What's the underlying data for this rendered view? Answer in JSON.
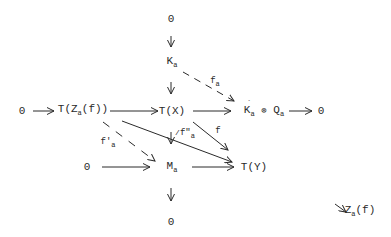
{
  "diagram": {
    "type": "commutative-diagram",
    "nodes": {
      "top_zero": "0",
      "K_a": {
        "base": "K",
        "sub": "a"
      },
      "row1_left_zero": "0",
      "T_Za_f": {
        "pre": "T(Z",
        "sub": "a",
        "post": "(f))"
      },
      "T_X": "T(X)",
      "Kprime_tensor_Q": {
        "k": "K",
        "k_prime": "´",
        "k_sub": "a",
        "op": "⊗",
        "q": "Q",
        "q_sub": "a"
      },
      "row1_right_zero": "0",
      "row2_left_zero": "0",
      "M_a": {
        "base": "M",
        "sub": "a"
      },
      "T_Y": "T(Y)",
      "bottom_zero": "0"
    },
    "labels": {
      "f_a": {
        "base": "f",
        "sub": "a"
      },
      "f_prime_a": {
        "base": "f'",
        "sub": "a"
      },
      "f_dprime_a": {
        "base": "f\"",
        "sub": "a"
      },
      "f": "f"
    },
    "footnote": {
      "arrow": "↘",
      "pre": "Z",
      "sub": "a",
      "post": "(f)"
    },
    "edges": [
      {
        "from": "top_zero",
        "to": "K_a",
        "style": "solid"
      },
      {
        "from": "K_a",
        "to": "T_X",
        "style": "solid"
      },
      {
        "from": "K_a",
        "to": "Kprime_tensor_Q",
        "style": "dashed",
        "label": "f_a"
      },
      {
        "from": "row1_left_zero",
        "to": "T_Za_f",
        "style": "solid"
      },
      {
        "from": "T_Za_f",
        "to": "T_X",
        "style": "solid"
      },
      {
        "from": "T_X",
        "to": "Kprime_tensor_Q",
        "style": "solid"
      },
      {
        "from": "Kprime_tensor_Q",
        "to": "row1_right_zero",
        "style": "solid"
      },
      {
        "from": "T_Za_f",
        "to": "M_a",
        "style": "dashed",
        "label": "f_prime_a"
      },
      {
        "from": "T_Za_f",
        "to": "T_Y",
        "style": "solid"
      },
      {
        "from": "T_X",
        "to": "M_a",
        "style": "solid",
        "label": "f_dprime_a"
      },
      {
        "from": "T_X",
        "to": "T_Y",
        "style": "solid",
        "label": "f"
      },
      {
        "from": "row2_left_zero",
        "to": "M_a",
        "style": "solid"
      },
      {
        "from": "M_a",
        "to": "T_Y",
        "style": "solid"
      },
      {
        "from": "M_a",
        "to": "bottom_zero",
        "style": "solid"
      }
    ],
    "colors": {
      "ink": "#2a2a2a",
      "background": "#ffffff"
    }
  }
}
